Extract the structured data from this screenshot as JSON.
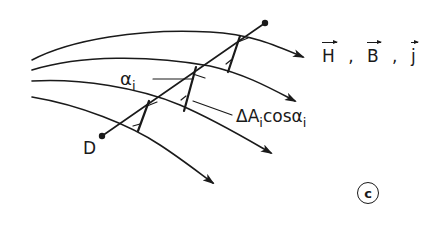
{
  "diagram": {
    "stroke_color": "#1a1a1a",
    "background": "#ffffff",
    "labels": {
      "vectors": [
        {
          "symbol": "H",
          "vector": true
        },
        {
          "symbol": "B",
          "vector": true
        },
        {
          "symbol": "j",
          "vector": true
        }
      ],
      "separator": ",",
      "alpha": {
        "base": "α",
        "sub": "i"
      },
      "area": {
        "prefix": "ΔA",
        "sub1": "i",
        "middle": "cosα",
        "sub2": "i"
      },
      "point": "D",
      "panel": "c"
    },
    "field_lines": 4,
    "cross_elements": 3
  }
}
